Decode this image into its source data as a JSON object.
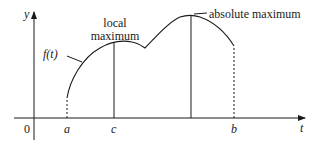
{
  "diagram": {
    "title": "",
    "axes": {
      "y_label": "y",
      "x_label": "t",
      "origin_label": "0"
    },
    "ticks": [
      {
        "id": "a",
        "label": "a"
      },
      {
        "id": "c",
        "label": "c"
      },
      {
        "id": "b",
        "label": "b"
      }
    ],
    "function_label": "f(t)",
    "annotations": {
      "local_max_line1": "local",
      "local_max_line2": "maximum",
      "absolute_max": "absolute maximum"
    },
    "colors": {
      "stroke": "#1a1a1a",
      "background": "#ffffff"
    }
  }
}
